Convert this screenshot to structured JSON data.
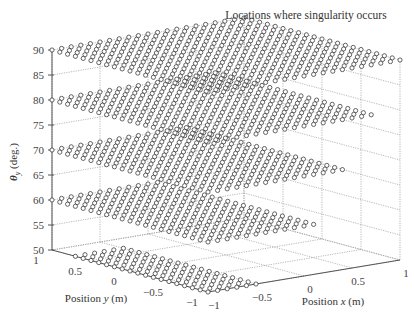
{
  "chart_data": {
    "type": "scatter",
    "title": "Locations where singularity occurs",
    "xlabel": "Position x (m)",
    "ylabel": "Position y (m)",
    "zlabel": "θy (deg.)",
    "xlim": [
      -1,
      1
    ],
    "ylim": [
      -1,
      1
    ],
    "zlim": [
      50,
      90
    ],
    "x_ticks": [
      "-1",
      "-0.5",
      "0",
      "0.5",
      "1"
    ],
    "y_ticks": [
      "1",
      "0.5",
      "0",
      "-0.5",
      "-1"
    ],
    "z_ticks": [
      "50",
      "55",
      "60",
      "65",
      "70",
      "75",
      "80",
      "85",
      "90"
    ],
    "grid": true,
    "marker": "open circle",
    "series": [
      {
        "name": "theta_y = 90",
        "z": 90,
        "description": "grid of (x,y) points over nearly the full domain"
      },
      {
        "name": "theta_y = 80",
        "z": 80,
        "description": "grid of (x,y) points, slightly reduced x extent"
      },
      {
        "name": "theta_y = 70",
        "z": 70,
        "description": "grid of (x,y) points, reduced x extent"
      },
      {
        "name": "theta_y = 60",
        "z": 60,
        "description": "grid of (x,y) points, smallest x extent"
      }
    ]
  },
  "labels": {
    "title": "Locations where singularity occurs",
    "xlabel_prefix": "Position ",
    "xlabel_var": "x",
    "xlabel_suffix": " (m)",
    "ylabel_prefix": "Position ",
    "ylabel_var": "y",
    "ylabel_suffix": " (m)",
    "zlabel_var": "θ",
    "zlabel_sub": "y",
    "zlabel_suffix": " (deg.)"
  }
}
